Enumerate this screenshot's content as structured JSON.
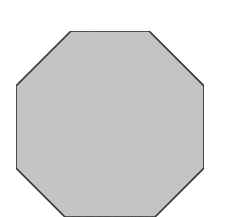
{
  "shape": {
    "type": "octagon",
    "fill": "#c4c4c4",
    "stroke": "#1a1a1a",
    "points": "71,31 149,31 204,86 204,168 155,217 65,217 16,168 16,86"
  },
  "background": "#ffffff"
}
